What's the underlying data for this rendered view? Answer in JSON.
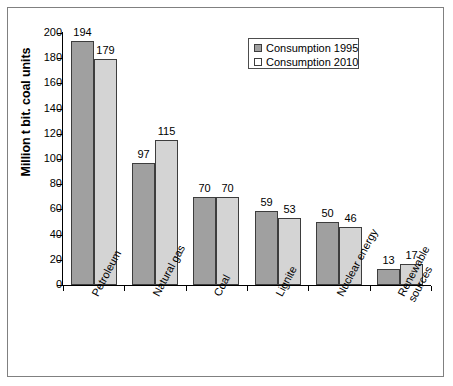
{
  "chart_data": {
    "type": "bar",
    "title": "",
    "subtitle": "",
    "xlabel": "",
    "ylabel": "Million t bit. coal units",
    "ylim": [
      0,
      200
    ],
    "yticks": [
      0,
      20,
      40,
      60,
      80,
      100,
      120,
      140,
      160,
      180,
      200
    ],
    "ytick_labels": [
      "0",
      "20",
      "40",
      "60",
      "80",
      "100",
      "120",
      "140",
      "160",
      "180",
      "200"
    ],
    "grid": false,
    "legend_position": "top-right",
    "categories": [
      "Petroleum",
      "Natural gas",
      "Coal",
      "Lignite",
      "Nuclear energy",
      "Renewable sources"
    ],
    "series": [
      {
        "name": "Consumption 1995",
        "color": "#a0a0a0",
        "values": [
          194,
          97,
          70,
          59,
          50,
          13
        ]
      },
      {
        "name": "Consumption 2010",
        "color": "#d4d4d4",
        "values": [
          179,
          115,
          70,
          53,
          46,
          17
        ]
      }
    ],
    "data_labels": [
      [
        "194",
        "179"
      ],
      [
        "97",
        "115"
      ],
      [
        "70",
        "70"
      ],
      [
        "59",
        "53"
      ],
      [
        "50",
        "46"
      ],
      [
        "13",
        "17"
      ]
    ]
  },
  "legend": {
    "items": [
      {
        "label": "Consumption 1995",
        "swatch": "filled-gray-swatch"
      },
      {
        "label": "Consumption 2010",
        "swatch": "filled-light-swatch"
      }
    ]
  },
  "axis": {
    "y_title": "Million t bit. coal units"
  },
  "colors": {
    "series_1": "#a0a0a0",
    "series_2": "#d4d4d4",
    "bar_outline": "#3d3d3d",
    "frame": "#808080",
    "axis": "#000000",
    "background": "#ffffff"
  }
}
